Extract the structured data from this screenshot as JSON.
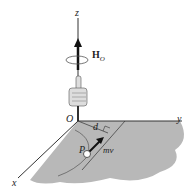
{
  "diagram": {
    "axes": {
      "z": "z",
      "y": "y",
      "x": "x",
      "origin": "O"
    },
    "angular_momentum": {
      "symbol": "H",
      "subscript": "O"
    },
    "distance": "d",
    "particle": "P",
    "momentum": "mv",
    "colors": {
      "plane": "#b8b8b8",
      "lines": "#333333",
      "background": "#ffffff"
    }
  }
}
